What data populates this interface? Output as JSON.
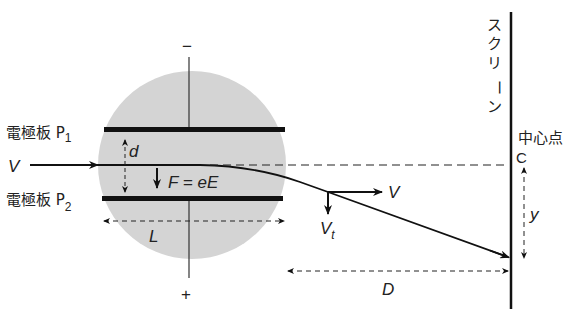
{
  "diagram": {
    "labels": {
      "plate_top": "電極板 P",
      "plate_top_sub": "1",
      "plate_bottom": "電極板 P",
      "plate_bottom_sub": "2",
      "minus": "−",
      "plus": "+",
      "velocity_in": "V",
      "gap": "d",
      "force": "F = eE",
      "length": "L",
      "velocity_out": "V",
      "velocity_transverse": "V",
      "velocity_transverse_sub": "t",
      "distance": "D",
      "deflection": "y",
      "screen": "スクリーン",
      "screen_chars": [
        "ス",
        "ク",
        "リ",
        "ー",
        "ン"
      ],
      "center_point": "中心点",
      "center_label": "C"
    },
    "colors": {
      "field_region": "#d4d4d4",
      "lines": "#111111",
      "background": "#ffffff"
    }
  }
}
